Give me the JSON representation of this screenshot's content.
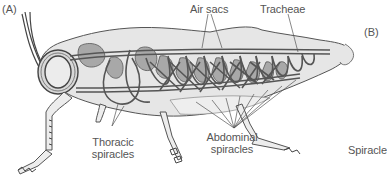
{
  "figure": {
    "panel_a": "(A)",
    "panel_b": "(B)",
    "labels": {
      "air_sacs": "Air sacs",
      "tracheae": "Tracheae",
      "thoracic_spiracles_1": "Thoracic",
      "thoracic_spiracles_2": "spiracles",
      "abdominal_spiracles_1": "Abdominal",
      "abdominal_spiracles_2": "spiracles",
      "spiracle": "Spiracle"
    },
    "colors": {
      "outline": "#444444",
      "body_fill": "#e4e4e4",
      "sac_fill": "#a8a8a8",
      "label_text": "#555555",
      "leader_line": "#555555"
    }
  }
}
